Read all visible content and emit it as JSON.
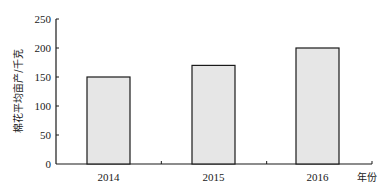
{
  "chart_data": {
    "type": "bar",
    "title": "",
    "xlabel": "年份",
    "ylabel": "棉花平均亩产/千克",
    "categories": [
      "2014",
      "2015",
      "2016"
    ],
    "values": [
      150,
      170,
      200
    ],
    "ylim": [
      0,
      250
    ],
    "yticks": [
      0,
      50,
      100,
      150,
      200,
      250
    ],
    "grid": false,
    "legend": null,
    "bar_fill": "#e6e6e6",
    "bar_stroke": "#1a1a1a"
  }
}
